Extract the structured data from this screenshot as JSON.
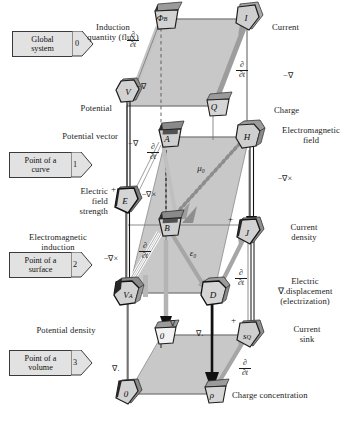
{
  "diagram": {
    "type": "classification-diagram"
  },
  "tags": [
    {
      "id": "tag0",
      "line1": "Global",
      "line2": "system",
      "num": "0",
      "x": 12,
      "y": 31
    },
    {
      "id": "tag1",
      "line1": "Point of a",
      "line2": "curve",
      "num": "1",
      "x": 9,
      "y": 152
    },
    {
      "id": "tag2",
      "line1": "Point of a",
      "line2": "surface",
      "num": "2",
      "x": 9,
      "y": 252
    },
    {
      "id": "tag3",
      "line1": "Point of a",
      "line2": "volume",
      "num": "3",
      "x": 9,
      "y": 350
    }
  ],
  "nodes": [
    {
      "id": "phiB",
      "label": "Φ",
      "sub": "B",
      "x": 160,
      "y": 17,
      "shape": "trapezoid",
      "name": "node-magnetic-flux"
    },
    {
      "id": "I",
      "label": "I",
      "sub": "",
      "x": 247,
      "y": 17,
      "shape": "pentagon",
      "name": "node-current"
    },
    {
      "id": "V",
      "label": "V",
      "sub": "",
      "x": 128,
      "y": 91,
      "shape": "hexagon",
      "name": "node-potential"
    },
    {
      "id": "Q",
      "label": "Q",
      "sub": "",
      "x": 212,
      "y": 104,
      "shape": "trapezoid",
      "name": "node-charge"
    },
    {
      "id": "A",
      "label": "A",
      "sub": "",
      "x": 165,
      "y": 135,
      "shape": "trapezoid",
      "name": "node-potential-vector"
    },
    {
      "id": "H",
      "label": "H",
      "sub": "",
      "x": 248,
      "y": 135,
      "shape": "cube",
      "name": "node-electromagnetic-field"
    },
    {
      "id": "E",
      "label": "E",
      "sub": "",
      "x": 126,
      "y": 199,
      "shape": "pentagon",
      "name": "node-electric-field-strength"
    },
    {
      "id": "B",
      "label": "B",
      "sub": "",
      "x": 165,
      "y": 224,
      "shape": "trapezoid",
      "name": "node-magnetic-induction"
    },
    {
      "id": "J",
      "label": "J",
      "sub": "",
      "x": 248,
      "y": 230,
      "shape": "pentagon",
      "name": "node-current-density"
    },
    {
      "id": "VA",
      "label": "V",
      "sub": "A",
      "x": 127,
      "y": 291,
      "shape": "cube",
      "name": "node-potential-density"
    },
    {
      "id": "D",
      "label": "D",
      "sub": "",
      "x": 213,
      "y": 291,
      "shape": "cube",
      "name": "node-electric-displacement"
    },
    {
      "id": "zeroMid",
      "label": "0",
      "sub": "",
      "x": 161,
      "y": 333,
      "shape": "trapezoid",
      "name": "node-zero-mid"
    },
    {
      "id": "sQ",
      "label": "s",
      "sub": "Q",
      "x": 248,
      "y": 333,
      "shape": "pentagon",
      "name": "node-current-sink"
    },
    {
      "id": "zeroBot",
      "label": "0",
      "sub": "",
      "x": 127,
      "y": 392,
      "shape": "pentagon",
      "name": "node-zero-bottom"
    },
    {
      "id": "rho",
      "label": "ρ",
      "sub": "",
      "x": 211,
      "y": 392,
      "shape": "trapezoid",
      "name": "node-charge-concentration"
    }
  ],
  "labels": [
    {
      "id": "l_induction",
      "text": "Induction\nquantity (flux)",
      "x": 63,
      "y": 22,
      "w": 100,
      "align": "center",
      "name": "label-induction-quantity"
    },
    {
      "id": "l_current",
      "text": "Current",
      "x": 272,
      "y": 22,
      "w": 70,
      "align": "left",
      "name": "label-current"
    },
    {
      "id": "l_potential",
      "text": "Potential",
      "x": 58,
      "y": 103,
      "w": 62,
      "align": "right",
      "name": "label-potential"
    },
    {
      "id": "l_charge",
      "text": "Charge",
      "x": 274,
      "y": 105,
      "w": 60,
      "align": "left",
      "name": "label-charge"
    },
    {
      "id": "l_potvec",
      "text": "Potential vector",
      "x": 26,
      "y": 131,
      "w": 94,
      "align": "right",
      "name": "label-potential-vector"
    },
    {
      "id": "l_emfield",
      "text": "Electromagnetic\nfield",
      "x": 272,
      "y": 129,
      "w": 82,
      "align": "left",
      "name": "label-electromagnetic-field"
    },
    {
      "id": "l_efs",
      "text": "Electric\nfield\nstrength",
      "x": 50,
      "y": 186,
      "w": 62,
      "align": "right",
      "name": "label-electric-field-strength"
    },
    {
      "id": "l_emind",
      "text": "Electromagnetic\ninduction",
      "x": 10,
      "y": 232,
      "w": 100,
      "align": "center",
      "name": "label-electromagnetic-induction"
    },
    {
      "id": "l_curdens",
      "text": "Current\ndensity",
      "x": 274,
      "y": 222,
      "w": 70,
      "align": "left",
      "name": "label-current-density"
    },
    {
      "id": "l_elecdisp",
      "text": "Electric\n∇.displacement\n(electrization)",
      "x": 258,
      "y": 275,
      "w": 94,
      "align": "center",
      "name": "label-electric-displacement"
    },
    {
      "id": "l_potdens",
      "text": "Potential density",
      "x": 18,
      "y": 325,
      "w": 98,
      "align": "center",
      "name": "label-potential-density"
    },
    {
      "id": "l_cursink",
      "text": "Current\nsink",
      "x": 277,
      "y": 324,
      "w": 64,
      "align": "left",
      "name": "label-current-sink"
    },
    {
      "id": "l_chconc",
      "text": "Charge concentration",
      "x": 232,
      "y": 392,
      "w": 118,
      "align": "left",
      "name": "label-charge-concentration"
    }
  ],
  "operators": [
    {
      "id": "op_nabla_v",
      "text": "−∇",
      "x": 133,
      "y": 83,
      "name": "op-minus-grad-potential"
    },
    {
      "id": "op_nabla_q",
      "text": "−∇",
      "x": 281,
      "y": 73,
      "name": "op-minus-grad-charge"
    },
    {
      "id": "op_nabla_potvec",
      "text": "−∇",
      "x": 126,
      "y": 140,
      "name": "op-minus-grad-potential-vector"
    },
    {
      "id": "op_curl_h",
      "text": "−∇×",
      "x": 276,
      "y": 175,
      "name": "op-minus-curl-h"
    },
    {
      "id": "op_curl_a",
      "text": "−∇×",
      "x": 138,
      "y": 191,
      "name": "op-minus-curl-a"
    },
    {
      "id": "op_curl_e",
      "text": "−∇×",
      "x": 101,
      "y": 255,
      "name": "op-minus-curl-e"
    },
    {
      "id": "op_div_1",
      "text": "∇.",
      "x": 170,
      "y": 320,
      "name": "op-div-1"
    },
    {
      "id": "op_div_2",
      "text": "∇.",
      "x": 196,
      "y": 330,
      "name": "op-div-2"
    },
    {
      "id": "op_div_3",
      "text": "∇.",
      "x": 113,
      "y": 365,
      "name": "op-div-3"
    },
    {
      "id": "op_mu0",
      "text": "μ₀",
      "x": 198,
      "y": 166,
      "name": "op-mu-zero"
    },
    {
      "id": "op_eps0",
      "text": "ε₀",
      "x": 189,
      "y": 251,
      "name": "op-epsilon-zero"
    }
  ],
  "time_derivatives": [
    {
      "id": "dt1",
      "x": 131,
      "y": 32,
      "name": "op-ddt-flux"
    },
    {
      "id": "dt2",
      "x": 240,
      "y": 62,
      "name": "op-ddt-current"
    },
    {
      "id": "dt3",
      "x": 151,
      "y": 144,
      "name": "op-ddt-potential-vector"
    },
    {
      "id": "dt4",
      "x": 143,
      "y": 243,
      "name": "op-ddt-b"
    },
    {
      "id": "dt5",
      "x": 239,
      "y": 270,
      "name": "op-ddt-j"
    },
    {
      "id": "dt6",
      "x": 243,
      "y": 360,
      "name": "op-ddt-sq"
    }
  ],
  "plus_signs": [
    {
      "id": "p1",
      "x": 113,
      "y": 189,
      "name": "sign-plus-e"
    },
    {
      "id": "p2",
      "x": 230,
      "y": 218,
      "name": "sign-plus-j"
    },
    {
      "id": "p3",
      "x": 233,
      "y": 318,
      "name": "sign-plus-sq"
    }
  ],
  "symbols": {
    "nabla": "∇",
    "partial": "∂",
    "t": "t",
    "curl": "∇×",
    "mu0": "μ₀",
    "eps0": "ε₀"
  },
  "colors": {
    "face_fill": "#c9c9c9",
    "node_fill": "#d0d0d0",
    "node_dark": "#2e2e2e",
    "arrow_gray": "#9a9a9a",
    "arrow_black": "#111111",
    "line_thin": "#6f6f6f",
    "tag_fill": "#e2e2e2",
    "text": "#1b1b1b"
  }
}
